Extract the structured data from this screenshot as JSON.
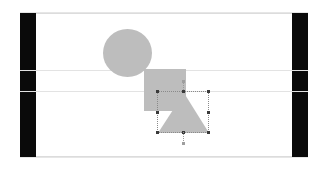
{
  "app": {
    "name": "vector-drawing-canvas",
    "background_color": "#ffffff"
  },
  "workspace": {
    "frame_border_color": "#e6e6e6",
    "page_background": "#ffffff",
    "page_border_color": "#dcdcdc"
  },
  "side_bars": [
    {
      "name": "left-margin-bar",
      "color": "#0a0a0a",
      "label": ""
    },
    {
      "name": "right-margin-bar",
      "color": "#0a0a0a",
      "label": ""
    }
  ],
  "guides": [
    {
      "name": "horizontal-guide-upper",
      "orientation": "horizontal",
      "color": "#e3e3e3",
      "label": ""
    },
    {
      "name": "horizontal-guide-lower",
      "orientation": "horizontal",
      "color": "#e3e3e3",
      "label": ""
    }
  ],
  "shapes": [
    {
      "id": "circle",
      "type": "ellipse",
      "fill": "#bdbdbd",
      "selected": false,
      "label": ""
    },
    {
      "id": "rectangle",
      "type": "rectangle",
      "fill": "#bdbdbd",
      "selected": false,
      "label": ""
    },
    {
      "id": "triangle",
      "type": "triangle",
      "fill": "#bdbdbd",
      "selected": true,
      "label": ""
    }
  ],
  "selection": {
    "target_shape": "triangle",
    "marker_color": "#3a3a3a",
    "outline_color": "#8a8a8a",
    "handle_count": 8,
    "handles": [
      {
        "name": "handle-top-left",
        "label": ""
      },
      {
        "name": "handle-top-center",
        "label": ""
      },
      {
        "name": "handle-top-right",
        "label": ""
      },
      {
        "name": "handle-middle-left",
        "label": ""
      },
      {
        "name": "handle-middle-right",
        "label": ""
      },
      {
        "name": "handle-bottom-left",
        "label": ""
      },
      {
        "name": "handle-bottom-center",
        "label": ""
      },
      {
        "name": "handle-bottom-right",
        "label": ""
      }
    ],
    "rotation_pivot_top_label": "",
    "rotation_pivot_bottom_label": ""
  }
}
